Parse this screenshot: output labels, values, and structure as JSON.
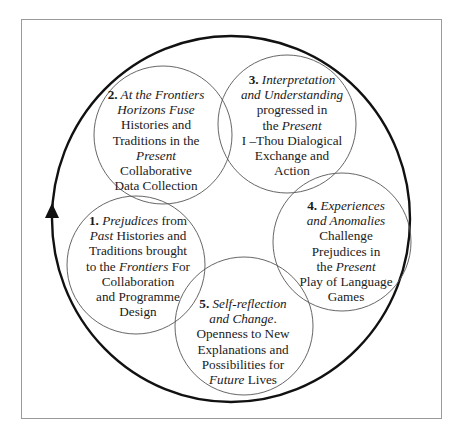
{
  "diagram": {
    "type": "cyclic-overlapping-circles",
    "cycle_direction": "clockwise",
    "arrow": {
      "position": "left",
      "direction": "up"
    },
    "colors": {
      "outer_ring": "#111111",
      "circle_stroke": "#555555",
      "frame": "#9a9a9a",
      "text": "#1a1a1a"
    },
    "stages": [
      {
        "number": "1.",
        "segments": [
          {
            "text": "Prejudices",
            "italic": true
          },
          {
            "text": " from ",
            "italic": false
          },
          {
            "text": "Past",
            "italic": true
          },
          {
            "text": " Histories and Traditions brought to the ",
            "italic": false
          },
          {
            "text": "Frontiers",
            "italic": true
          },
          {
            "text": " For Collaboration and Programme Design",
            "italic": false
          }
        ],
        "lines": [
          "1. Prejudices from",
          "Past Histories and",
          "Traditions brought",
          "to the Frontiers For",
          "Collaboration",
          "and Programme",
          "Design"
        ]
      },
      {
        "number": "2.",
        "lines": [
          "2. At the Frontiers",
          "Horizons Fuse",
          "Histories and",
          "Traditions in the",
          "Present",
          "Collaborative",
          "Data Collection"
        ]
      },
      {
        "number": "3.",
        "lines": [
          "3. Interpretation",
          "and Understanding",
          "progressed  in",
          "the Present",
          "I –Thou Dialogical",
          "Exchange and",
          "Action"
        ]
      },
      {
        "number": "4.",
        "lines": [
          "4. Experiences",
          "and Anomalies",
          "Challenge",
          "Prejudices  in",
          "the Present",
          "Play of Language",
          "Games"
        ]
      },
      {
        "number": "5.",
        "lines": [
          "5. Self-reflection",
          "and Change.",
          "Openness to New",
          "Explanations and",
          "Possibilities for",
          "Future Lives"
        ]
      }
    ]
  },
  "labels": {
    "s1": {
      "num": "1.",
      "l1a": "Prejudices",
      "l1b": " from",
      "l2a": "Past",
      "l2b": " Histories and",
      "l3": "Traditions brought",
      "l4a": "to the ",
      "l4b": "Frontiers",
      "l4c": " For",
      "l5": "Collaboration",
      "l6": "and Programme",
      "l7": "Design"
    },
    "s2": {
      "num": "2.",
      "l1": " At the Frontiers",
      "l2": "Horizons Fuse",
      "l3": "Histories and",
      "l4": "Traditions in the",
      "l5": "Present",
      "l6": "Collaborative",
      "l7": "Data Collection"
    },
    "s3": {
      "num": "3.",
      "l1": " Interpretation",
      "l2": "and Understanding",
      "l3": "progressed  in",
      "l4a": "the ",
      "l4b": "Present",
      "l5": "I –Thou Dialogical",
      "l6": "Exchange and",
      "l7": "Action"
    },
    "s4": {
      "num": "4.",
      "l1": " Experiences",
      "l2": "and Anomalies",
      "l3": "Challenge",
      "l4": "Prejudices  in",
      "l5a": "the ",
      "l5b": "Present",
      "l6": "Play of Language",
      "l7": "Games"
    },
    "s5": {
      "num": "5.",
      "l1": " Self-reflection",
      "l2": "and Change",
      "l2b": ".",
      "l3": "Openness to New",
      "l4": "Explanations and",
      "l5": "Possibilities for",
      "l6a": "Future",
      "l6b": " Lives"
    }
  }
}
